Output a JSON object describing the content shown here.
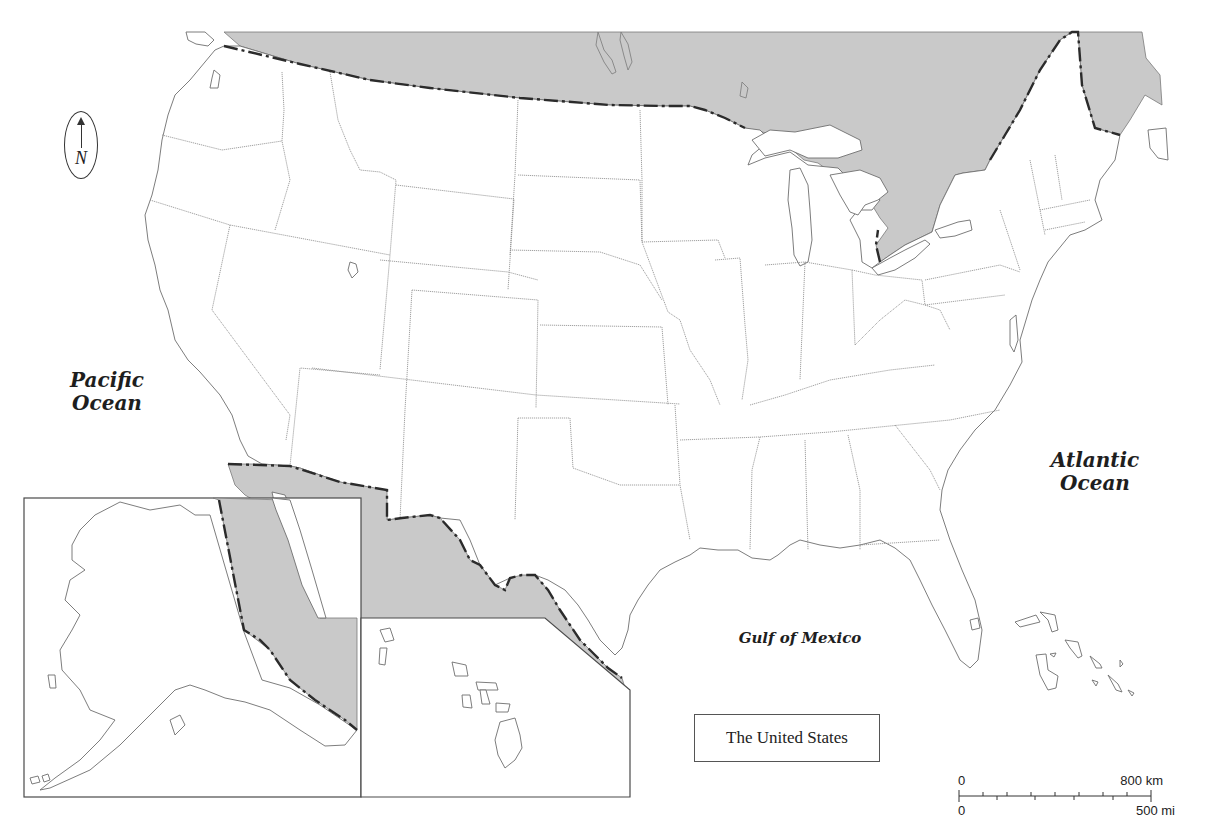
{
  "map": {
    "title": "The United States",
    "labels": {
      "pacific": "Pacific Ocean",
      "atlantic": "Atlantic Ocean",
      "gulf": "Gulf of Mexico"
    },
    "compass": {
      "icon": "north-arrow-icon",
      "letter": "N"
    },
    "scale_bar": {
      "km_start": "0",
      "km_end": "800 km",
      "mi_start": "0",
      "mi_end": "500 mi"
    },
    "insets": [
      "Alaska",
      "Hawaii"
    ],
    "colors": {
      "us_land": "#ffffff",
      "foreign_land": "#c9c9c9",
      "international_border": "#2b2b2b",
      "state_border": "#8a8a8a"
    }
  }
}
